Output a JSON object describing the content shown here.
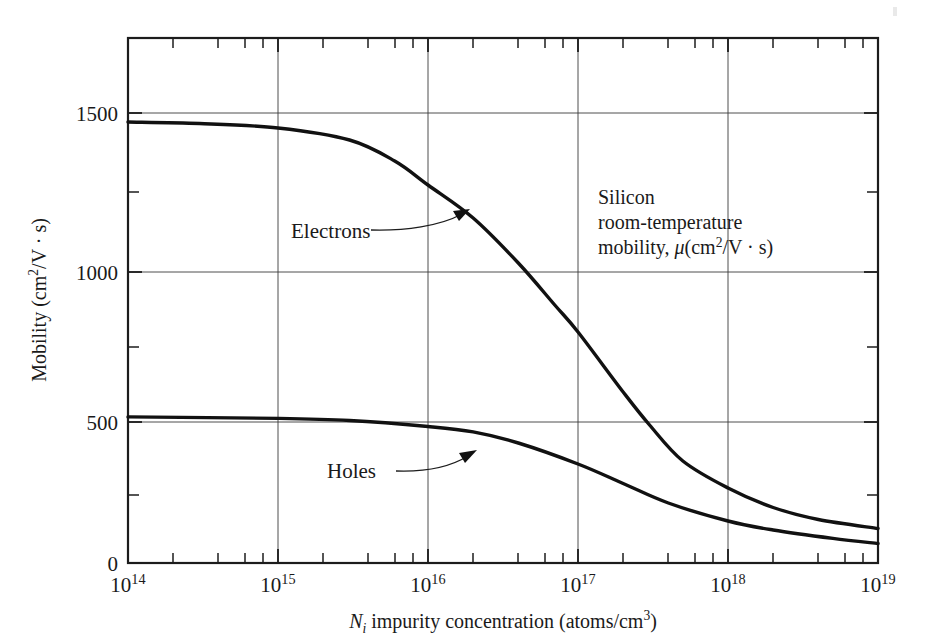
{
  "chart_data": {
    "type": "line",
    "title": "",
    "annotation": {
      "line1": "Silicon",
      "line2": "room-temperature",
      "line3_prefix": "mobility, ",
      "line3_mu": "μ",
      "line3_open": "(cm",
      "line3_sup": "2",
      "line3_rest": "/V · s)"
    },
    "xlabel_parts": {
      "symbol": "N",
      "subscript": "i",
      "text": " impurity concentration (atoms/cm",
      "sup": "3",
      "close": ")"
    },
    "xlabel": "N_i impurity concentration (atoms/cm^3)",
    "ylabel_parts": {
      "text": "Mobility (cm",
      "sup": "2",
      "rest": "/V · s)"
    },
    "ylabel": "Mobility (cm^2/V · s)",
    "xscale": "log",
    "xlim": [
      100000000000000.0,
      1e+19
    ],
    "ylim": [
      0,
      1750
    ],
    "xtick_labels": [
      "10¹14",
      "10¹15",
      "10¹16",
      "10¹17",
      "10¹18",
      "10¹19"
    ],
    "xticks": [
      {
        "base": "10",
        "exp": "14",
        "value": 100000000000000.0
      },
      {
        "base": "10",
        "exp": "15",
        "value": 1000000000000000.0
      },
      {
        "base": "10",
        "exp": "16",
        "value": 1e+16
      },
      {
        "base": "10",
        "exp": "17",
        "value": 1e+17
      },
      {
        "base": "10",
        "exp": "18",
        "value": 1e+18
      },
      {
        "base": "10",
        "exp": "19",
        "value": 1e+19
      }
    ],
    "xminor_mantissas": [
      2,
      4,
      6,
      8
    ],
    "yticks_labeled": [
      0,
      500,
      1000,
      1500
    ],
    "ytick_labels": [
      "0",
      "500",
      "1000",
      "1500"
    ],
    "yminor": [
      250,
      750,
      1250,
      1750
    ],
    "grid": "both-major",
    "legend_position": "inline-callouts",
    "series": [
      {
        "name": "Electrons",
        "label": "Electrons",
        "points": [
          {
            "x": 100000000000000.0,
            "y": 1470
          },
          {
            "x": 300000000000000.0,
            "y": 1465
          },
          {
            "x": 1000000000000000.0,
            "y": 1450
          },
          {
            "x": 3000000000000000.0,
            "y": 1410
          },
          {
            "x": 6000000000000000.0,
            "y": 1340
          },
          {
            "x": 1e+16,
            "y": 1260
          },
          {
            "x": 2e+16,
            "y": 1150
          },
          {
            "x": 4e+16,
            "y": 1000
          },
          {
            "x": 7e+16,
            "y": 860
          },
          {
            "x": 1e+17,
            "y": 770
          },
          {
            "x": 2e+17,
            "y": 570
          },
          {
            "x": 3e+17,
            "y": 460
          },
          {
            "x": 5e+17,
            "y": 340
          },
          {
            "x": 1e+18,
            "y": 250
          },
          {
            "x": 2e+18,
            "y": 185
          },
          {
            "x": 4e+18,
            "y": 145
          },
          {
            "x": 1e+19,
            "y": 115
          }
        ]
      },
      {
        "name": "Holes",
        "label": "Holes",
        "points": [
          {
            "x": 100000000000000.0,
            "y": 487
          },
          {
            "x": 1000000000000000.0,
            "y": 482
          },
          {
            "x": 3000000000000000.0,
            "y": 475
          },
          {
            "x": 1e+16,
            "y": 455
          },
          {
            "x": 2e+16,
            "y": 437
          },
          {
            "x": 4e+16,
            "y": 400
          },
          {
            "x": 1e+17,
            "y": 330
          },
          {
            "x": 2e+17,
            "y": 265
          },
          {
            "x": 4e+17,
            "y": 200
          },
          {
            "x": 1e+18,
            "y": 140
          },
          {
            "x": 2e+18,
            "y": 110
          },
          {
            "x": 5e+18,
            "y": 82
          },
          {
            "x": 1e+19,
            "y": 65
          }
        ]
      }
    ],
    "callouts": [
      {
        "label": "Electrons",
        "target_x": 2e+16,
        "target_y": 1150
      },
      {
        "label": "Holes",
        "target_x": 2.2e+16,
        "target_y": 435
      }
    ],
    "colors": {
      "curve": "#111111",
      "frame": "#1c1c1c",
      "grid": "#3a3a3a",
      "background": "#ffffff"
    }
  }
}
